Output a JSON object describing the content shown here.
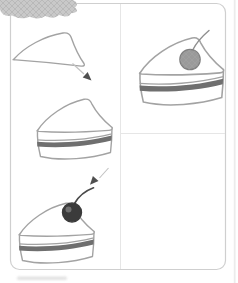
{
  "page": {
    "background": "#ffffff"
  },
  "colors": {
    "frame_border": "#cfcfcf",
    "divider": "#e6e6e6",
    "outline": "#a3a3a3",
    "slice_fill": "#ffffff",
    "filling_stripe": "#6f6f6f",
    "cherry_dark": "#3b3b3b",
    "cherry_highlight": "#7a7a7a",
    "cherry_gray": "#9a9a9a",
    "cherry_gray_outline": "#7f7f7f",
    "stem_dark": "#4a4a4a",
    "stem_gray": "#8f8f8f",
    "cloud": "#c9c9c9",
    "hatch": "#a6a6a6",
    "arrow_line": "#c2c2c2",
    "arrow_head": "#4f4f4f",
    "smudge": "#dcdcdc"
  },
  "illustration": {
    "subject": "step-by-step drawing of a cake slice",
    "steps": [
      {
        "order": 1,
        "element": "wedge-outline"
      },
      {
        "order": 2,
        "element": "layered-slice"
      },
      {
        "order": 3,
        "element": "slice-with-cherry"
      },
      {
        "order": 4,
        "element": "finished-slice-with-cherry"
      }
    ],
    "connectors": [
      {
        "name": "down-right-arrow"
      },
      {
        "name": "down-left-arrow"
      }
    ],
    "decorations": [
      {
        "name": "cloud-scribble-top-left"
      },
      {
        "name": "scan-smudge-bottom-left"
      },
      {
        "name": "page-edge-streak-right"
      }
    ]
  }
}
